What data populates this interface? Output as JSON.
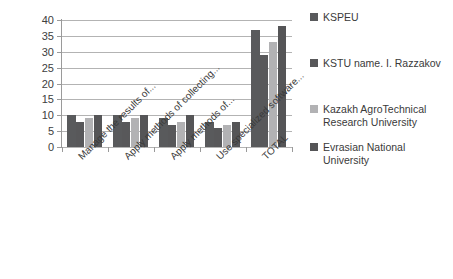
{
  "chart_data": {
    "type": "bar",
    "title": "",
    "subtitle": "",
    "xlabel": "",
    "ylabel": "",
    "ylim": [
      0,
      40
    ],
    "ytick_step": 5,
    "yticks": [
      "0",
      "5",
      "10",
      "15",
      "20",
      "25",
      "30",
      "35",
      "40"
    ],
    "grid": true,
    "grid_axis": "y",
    "legend_position": "right",
    "categories": [
      "Manage the results of...",
      "Apply methods of collecting...",
      "Apply methods of...",
      "Use specialized software...",
      "TOTAL"
    ],
    "series": [
      {
        "name": "KSPEU",
        "color": "#595a5c",
        "values": [
          10,
          10,
          9,
          8,
          37
        ]
      },
      {
        "name": "KSTU name. I. Razzakov",
        "color": "#58585a",
        "values": [
          8,
          8,
          7,
          6,
          29
        ]
      },
      {
        "name": "Kazakh AgroTechnical Research University",
        "color": "#b2b2b4",
        "values": [
          9,
          9,
          8,
          7,
          33
        ]
      },
      {
        "name": "Evrasian National University",
        "color": "#555557",
        "values": [
          10,
          10,
          10,
          8,
          38
        ]
      }
    ]
  },
  "colors": {
    "background": "#ffffff",
    "gridline": "#b3b3b3",
    "axis": "#9a9a9a",
    "text": "#3a3a3a",
    "series_dark": "#58585a",
    "series_light": "#b2b2b4"
  }
}
